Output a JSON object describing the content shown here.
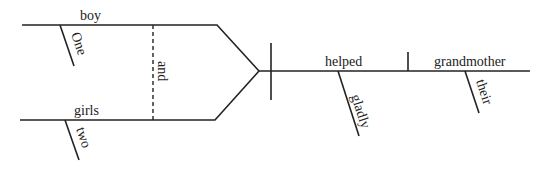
{
  "diagram": {
    "type": "sentence-diagram",
    "sentence_parts": {
      "subject_top": "boy",
      "subject_top_modifier": "One",
      "subject_bottom": "girls",
      "subject_bottom_modifier": "two",
      "conjunction": "and",
      "verb": "helped",
      "verb_modifier": "gladly",
      "direct_object": "grandmother",
      "object_modifier": "their"
    },
    "colors": {
      "line": "#222222",
      "background": "#ffffff"
    }
  }
}
